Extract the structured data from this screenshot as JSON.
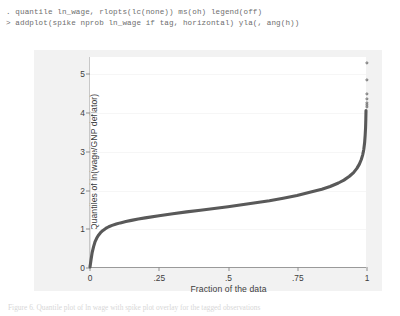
{
  "console": {
    "lines": [
      ". quantile ln_wage, rlopts(lc(none)) ms(oh) legend(off)",
      "> addplot(spike nprob ln_wage if tag, horizontal) yla(, ang(h))"
    ]
  },
  "bottom_caption": {
    "text": "Figure 6. Quantile plot of ln wage with spike plot overlay for the tagged observations"
  },
  "chart_data": {
    "type": "line",
    "title": "",
    "xlabel": "Fraction of the data",
    "ylabel": "Quantiles of ln(wage/GNP deflator)",
    "xlim": [
      0,
      1
    ],
    "ylim": [
      0,
      5.45
    ],
    "grid": true,
    "legend": "off",
    "xticks": [
      0,
      0.25,
      0.5,
      0.75,
      1
    ],
    "xtick_labels": [
      "0",
      ".25",
      ".5",
      ".75",
      "1"
    ],
    "yticks": [
      0,
      1,
      2,
      3,
      4,
      5
    ],
    "ytick_labels": [
      "0",
      "1",
      "2",
      "3",
      "4",
      "5"
    ],
    "line_color": "#595959",
    "marker_color": "#6b6b6b",
    "series": [
      {
        "name": "quantiles",
        "x": [
          0.0,
          0.004,
          0.008,
          0.013,
          0.018,
          0.024,
          0.03,
          0.038,
          0.047,
          0.057,
          0.068,
          0.08,
          0.095,
          0.11,
          0.13,
          0.15,
          0.175,
          0.2,
          0.25,
          0.3,
          0.35,
          0.4,
          0.45,
          0.5,
          0.55,
          0.6,
          0.65,
          0.7,
          0.75,
          0.8,
          0.84,
          0.87,
          0.9,
          0.92,
          0.94,
          0.955,
          0.967,
          0.976,
          0.983,
          0.988,
          0.992,
          0.995,
          0.997,
          0.9985,
          0.9993,
          1.0
        ],
        "y": [
          0.0,
          0.2,
          0.38,
          0.53,
          0.65,
          0.745,
          0.82,
          0.89,
          0.95,
          1.0,
          1.045,
          1.08,
          1.115,
          1.145,
          1.18,
          1.21,
          1.245,
          1.275,
          1.33,
          1.38,
          1.43,
          1.475,
          1.52,
          1.565,
          1.615,
          1.665,
          1.72,
          1.785,
          1.855,
          1.945,
          2.02,
          2.09,
          2.18,
          2.255,
          2.355,
          2.45,
          2.56,
          2.67,
          2.79,
          2.91,
          3.05,
          3.23,
          3.42,
          3.62,
          3.83,
          4.06
        ]
      }
    ],
    "outlier_markers": {
      "name": "spike plot tagged observations",
      "marker_symbol": "open-circle",
      "x": [
        1.0,
        1.0,
        1.0,
        1.0,
        1.0,
        1.0,
        1.0
      ],
      "y": [
        5.3,
        4.85,
        4.5,
        4.36,
        4.27,
        4.21,
        4.16
      ]
    },
    "spike_line": {
      "x": 0.0,
      "y_from": 0.0,
      "y_to": 4.05,
      "color": "#e2e2e2"
    }
  }
}
